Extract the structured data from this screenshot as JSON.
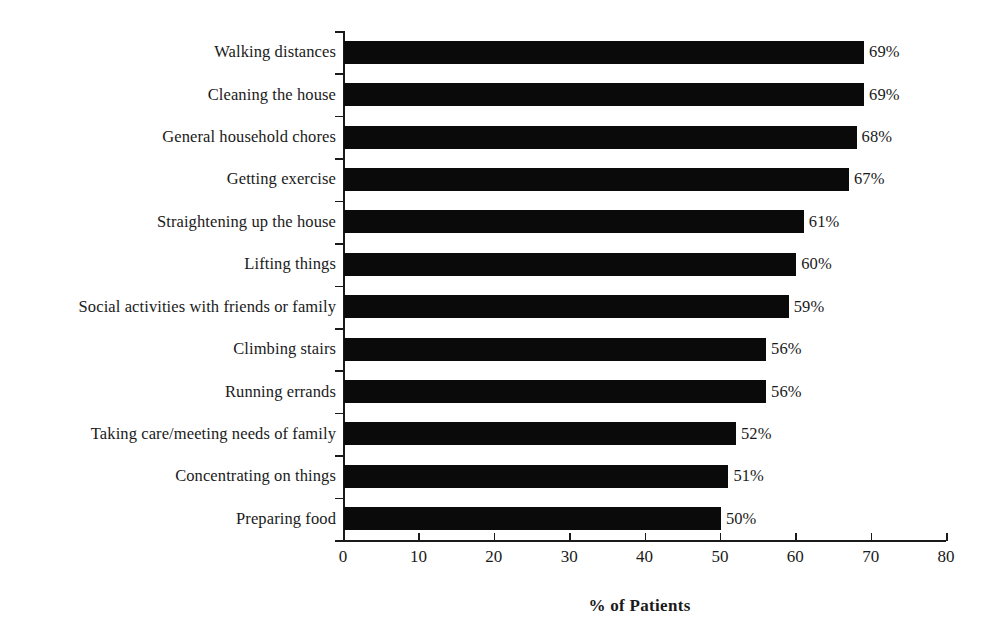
{
  "chart_data": {
    "type": "bar",
    "orientation": "horizontal",
    "title": "",
    "xlabel": "% of Patients",
    "ylabel": "",
    "xlim": [
      0,
      80
    ],
    "xticks": [
      0,
      10,
      20,
      30,
      40,
      50,
      60,
      70,
      80
    ],
    "xtick_labels": [
      "0",
      "10",
      "20",
      "30",
      "40",
      "50",
      "60",
      "70",
      "80"
    ],
    "grid": false,
    "legend": null,
    "bar_color": "#0a0a0a",
    "value_label_suffix": "%",
    "categories": [
      "Walking distances",
      "Cleaning the house",
      "General household chores",
      "Getting exercise",
      "Straightening up the house",
      "Lifting things",
      "Social activities with friends or family",
      "Climbing stairs",
      "Running errands",
      "Taking care/meeting needs of family",
      "Concentrating on things",
      "Preparing food"
    ],
    "values": [
      69,
      69,
      68,
      67,
      61,
      60,
      59,
      56,
      56,
      52,
      51,
      50
    ],
    "data_labels": [
      "69%",
      "69%",
      "68%",
      "67%",
      "61%",
      "60%",
      "59%",
      "56%",
      "56%",
      "52%",
      "51%",
      "50%"
    ]
  }
}
